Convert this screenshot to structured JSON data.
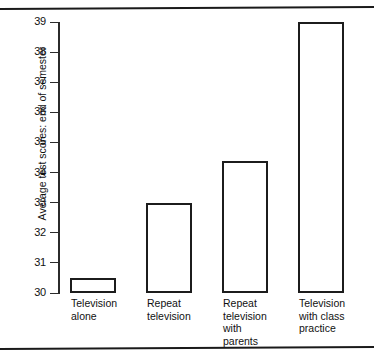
{
  "chart_data": {
    "type": "bar",
    "title": "",
    "subtitle": "",
    "xlabel": "",
    "ylabel": "Average test scores: end of semester",
    "categories": [
      "Television alone",
      "Repeat television",
      "Repeat television with parents",
      "Television with class practice"
    ],
    "category_lines": [
      [
        "Television",
        "alone"
      ],
      [
        "Repeat",
        "television"
      ],
      [
        "Repeat",
        "television",
        "with",
        "parents"
      ],
      [
        "Television",
        "with class",
        "practice"
      ]
    ],
    "values": [
      30.5,
      33.0,
      34.4,
      39.0
    ],
    "ylim": [
      30,
      39
    ],
    "y_ticks": [
      39,
      38,
      37,
      36,
      35,
      34,
      33,
      32,
      31,
      30
    ],
    "y_tick_labels": [
      "39",
      "38",
      "37",
      "36",
      "35",
      "34",
      "33",
      "32",
      "31",
      "30"
    ],
    "grid": false,
    "legend": null,
    "legend_position": "none",
    "bar_fill": "#ffffff",
    "bar_edge_color": "#1c1c1c",
    "annotations": []
  },
  "figure": {
    "background": "#ffffff",
    "rule_color": "#1a1a1a"
  }
}
